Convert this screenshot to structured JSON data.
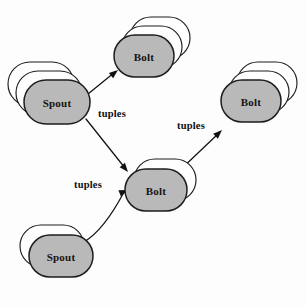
{
  "diagram": {
    "type": "node-link-diagram",
    "background_color": "#fdfdfd",
    "node_fill_color": "#b9b9b9",
    "node_stroke_color": "#1d1d1d",
    "edge_color": "#121212",
    "nodes": [
      {
        "id": "spout-top-left",
        "label": "Spout",
        "kind": "spout",
        "cx": 57,
        "cy": 102,
        "rx": 33,
        "ry": 22,
        "stack_count": 2,
        "stack_dx": -8,
        "stack_dy": -9
      },
      {
        "id": "bolt-top",
        "label": "Bolt",
        "kind": "bolt",
        "cx": 144,
        "cy": 56,
        "rx": 30,
        "ry": 21,
        "stack_count": 2,
        "stack_dx": 8,
        "stack_dy": -9
      },
      {
        "id": "bolt-right",
        "label": "Bolt",
        "kind": "bolt",
        "cx": 251,
        "cy": 101,
        "rx": 30,
        "ry": 21,
        "stack_count": 2,
        "stack_dx": 8,
        "stack_dy": -9
      },
      {
        "id": "bolt-middle",
        "label": "Bolt",
        "kind": "bolt",
        "cx": 156,
        "cy": 190,
        "rx": 31,
        "ry": 21,
        "stack_count": 1,
        "stack_dx": 9,
        "stack_dy": -10
      },
      {
        "id": "spout-bottom-left",
        "label": "Spout",
        "kind": "spout",
        "cx": 61,
        "cy": 256,
        "rx": 32,
        "ry": 21,
        "stack_count": 1,
        "stack_dx": -9,
        "stack_dy": -10
      }
    ],
    "edges": [
      {
        "id": "edge-spout-top-to-bolt-top",
        "from": "spout-top-left",
        "to": "bolt-top",
        "path": "M 88 94 L 115 72",
        "arrow_x": 118,
        "arrow_y": 70,
        "arrow_angle": -39
      },
      {
        "id": "edge-spout-top-to-bolt-middle",
        "from": "spout-top-left",
        "to": "bolt-middle",
        "path": "M 86 119 L 125 168",
        "arrow_x": 128,
        "arrow_y": 172,
        "arrow_angle": 51
      },
      {
        "id": "edge-bolt-middle-to-bolt-right",
        "from": "bolt-middle",
        "to": "bolt-right",
        "path": "M 178 172 L 219 133",
        "arrow_x": 222,
        "arrow_y": 130,
        "arrow_angle": -44
      },
      {
        "id": "edge-spout-bottom-to-bolt-middle",
        "from": "spout-bottom-left",
        "to": "bolt-middle",
        "path": "M 84 242 Q 104 230 124 192",
        "arrow_x": 128,
        "arrow_y": 190,
        "arrow_angle": -22
      }
    ],
    "edge_labels": [
      {
        "id": "tuples-label-upper-left",
        "text": "tuples",
        "x": 112,
        "y": 113
      },
      {
        "id": "tuples-label-right",
        "text": "tuples",
        "x": 191,
        "y": 125
      },
      {
        "id": "tuples-label-lower-left",
        "text": "tuples",
        "x": 88,
        "y": 184
      }
    ]
  }
}
